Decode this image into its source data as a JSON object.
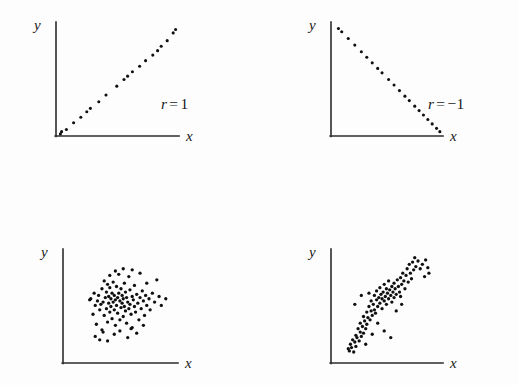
{
  "figure": {
    "background_color": "#fdfdfd",
    "ink_color": "#101010",
    "width": 518,
    "height": 385
  },
  "panels": [
    {
      "id": "panel-r-1",
      "position": "top-left",
      "x_axis_label": "x",
      "y_axis_label": "y",
      "r_symbol": "r",
      "r_equals": "=",
      "r_value": "1",
      "r_label_full": "r = 1",
      "pattern": "perfect positive linear"
    },
    {
      "id": "panel-r-neg1",
      "position": "top-right",
      "x_axis_label": "x",
      "y_axis_label": "y",
      "r_symbol": "r",
      "r_equals": "=",
      "r_value": "−1",
      "r_label_full": "r = −1",
      "pattern": "perfect negative linear"
    },
    {
      "id": "panel-r-point4",
      "position": "bottom-left",
      "x_axis_label": "x",
      "y_axis_label": "y",
      "r_symbol": "r",
      "r_equals": "=",
      "r_value": ".4",
      "r_label_full": "r = .4",
      "pattern": "weak positive scatter"
    },
    {
      "id": "panel-r-point8",
      "position": "bottom-right",
      "x_axis_label": "x",
      "y_axis_label": "y",
      "r_symbol": "r",
      "r_equals": "=",
      "r_value": ".8",
      "r_label_full": "r = .8",
      "pattern": "strong positive scatter"
    }
  ],
  "chart_data": [
    {
      "type": "scatter",
      "title": "r = 1",
      "xlabel": "x",
      "ylabel": "y",
      "r": 1.0,
      "xlim": [
        0,
        100
      ],
      "ylim": [
        0,
        100
      ],
      "grid": false,
      "legend": "none",
      "points": [
        [
          2,
          1
        ],
        [
          3,
          3
        ],
        [
          7,
          5
        ],
        [
          13,
          11
        ],
        [
          19,
          16
        ],
        [
          24,
          21
        ],
        [
          27,
          24
        ],
        [
          34,
          30
        ],
        [
          40,
          36
        ],
        [
          49,
          44
        ],
        [
          55,
          50
        ],
        [
          58,
          53
        ],
        [
          62,
          57
        ],
        [
          68,
          62
        ],
        [
          73,
          67
        ],
        [
          79,
          72
        ],
        [
          83,
          76
        ],
        [
          86,
          80
        ],
        [
          91,
          85
        ],
        [
          96,
          92
        ],
        [
          98,
          95
        ]
      ]
    },
    {
      "type": "scatter",
      "title": "r = −1",
      "xlabel": "x",
      "ylabel": "y",
      "r": -1.0,
      "xlim": [
        0,
        100
      ],
      "ylim": [
        0,
        100
      ],
      "grid": false,
      "legend": "none",
      "points": [
        [
          5,
          96
        ],
        [
          8,
          93
        ],
        [
          14,
          87
        ],
        [
          20,
          81
        ],
        [
          26,
          75
        ],
        [
          31,
          70
        ],
        [
          36,
          65
        ],
        [
          41,
          60
        ],
        [
          45,
          56
        ],
        [
          51,
          50
        ],
        [
          56,
          45
        ],
        [
          61,
          40
        ],
        [
          66,
          35
        ],
        [
          70,
          31
        ],
        [
          75,
          26
        ],
        [
          79,
          22
        ],
        [
          83,
          18
        ],
        [
          87,
          14
        ],
        [
          91,
          10
        ],
        [
          95,
          6
        ],
        [
          98,
          3
        ]
      ]
    },
    {
      "type": "scatter",
      "title": "r = .4",
      "xlabel": "x",
      "ylabel": "y",
      "r": 0.4,
      "xlim": [
        0,
        100
      ],
      "ylim": [
        0,
        100
      ],
      "grid": false,
      "legend": "none",
      "points": [
        [
          22,
          56
        ],
        [
          23,
          57
        ],
        [
          25,
          43
        ],
        [
          26,
          62
        ],
        [
          27,
          51
        ],
        [
          28,
          34
        ],
        [
          29,
          55
        ],
        [
          30,
          60
        ],
        [
          31,
          47
        ],
        [
          32,
          52
        ],
        [
          33,
          29
        ],
        [
          33,
          66
        ],
        [
          34,
          54
        ],
        [
          35,
          42
        ],
        [
          35,
          73
        ],
        [
          36,
          58
        ],
        [
          37,
          48
        ],
        [
          37,
          63
        ],
        [
          38,
          36
        ],
        [
          38,
          70
        ],
        [
          39,
          53
        ],
        [
          39,
          59
        ],
        [
          40,
          45
        ],
        [
          40,
          67
        ],
        [
          41,
          50
        ],
        [
          41,
          57
        ],
        [
          42,
          39
        ],
        [
          42,
          62
        ],
        [
          43,
          54
        ],
        [
          43,
          72
        ],
        [
          44,
          47
        ],
        [
          44,
          60
        ],
        [
          45,
          33
        ],
        [
          45,
          56
        ],
        [
          46,
          51
        ],
        [
          46,
          68
        ],
        [
          47,
          44
        ],
        [
          47,
          58
        ],
        [
          48,
          62
        ],
        [
          48,
          79
        ],
        [
          49,
          38
        ],
        [
          49,
          55
        ],
        [
          50,
          49
        ],
        [
          50,
          66
        ],
        [
          51,
          53
        ],
        [
          51,
          60
        ],
        [
          52,
          41
        ],
        [
          52,
          57
        ],
        [
          53,
          50
        ],
        [
          53,
          71
        ],
        [
          54,
          46
        ],
        [
          54,
          63
        ],
        [
          55,
          35
        ],
        [
          55,
          58
        ],
        [
          56,
          54
        ],
        [
          57,
          48
        ],
        [
          57,
          77
        ],
        [
          58,
          52
        ],
        [
          58,
          65
        ],
        [
          59,
          43
        ],
        [
          60,
          59
        ],
        [
          60,
          31
        ],
        [
          61,
          56
        ],
        [
          62,
          50
        ],
        [
          62,
          69
        ],
        [
          63,
          45
        ],
        [
          64,
          61
        ],
        [
          65,
          53
        ],
        [
          66,
          38
        ],
        [
          67,
          58
        ],
        [
          68,
          48
        ],
        [
          69,
          64
        ],
        [
          70,
          55
        ],
        [
          71,
          42
        ],
        [
          72,
          60
        ],
        [
          73,
          51
        ],
        [
          75,
          57
        ],
        [
          76,
          47
        ],
        [
          78,
          62
        ],
        [
          80,
          54
        ],
        [
          82,
          74
        ],
        [
          84,
          59
        ],
        [
          86,
          51
        ],
        [
          90,
          57
        ],
        [
          27,
          23
        ],
        [
          31,
          20
        ],
        [
          38,
          19
        ],
        [
          34,
          27
        ],
        [
          44,
          25
        ],
        [
          49,
          28
        ],
        [
          56,
          22
        ],
        [
          59,
          30
        ],
        [
          64,
          26
        ],
        [
          70,
          33
        ],
        [
          73,
          71
        ],
        [
          67,
          80
        ],
        [
          60,
          83
        ],
        [
          52,
          84
        ],
        [
          45,
          82
        ],
        [
          40,
          78
        ]
      ]
    },
    {
      "type": "scatter",
      "title": "r = .8",
      "xlabel": "x",
      "ylabel": "y",
      "r": 0.8,
      "xlim": [
        0,
        100
      ],
      "ylim": [
        0,
        100
      ],
      "grid": false,
      "legend": "none",
      "points": [
        [
          14,
          12
        ],
        [
          15,
          10
        ],
        [
          16,
          16
        ],
        [
          17,
          13
        ],
        [
          18,
          20
        ],
        [
          19,
          9
        ],
        [
          20,
          18
        ],
        [
          21,
          24
        ],
        [
          21,
          14
        ],
        [
          22,
          22
        ],
        [
          23,
          30
        ],
        [
          24,
          19
        ],
        [
          25,
          27
        ],
        [
          25,
          35
        ],
        [
          26,
          23
        ],
        [
          27,
          32
        ],
        [
          28,
          41
        ],
        [
          28,
          26
        ],
        [
          29,
          37
        ],
        [
          30,
          30
        ],
        [
          31,
          45
        ],
        [
          31,
          34
        ],
        [
          32,
          40
        ],
        [
          33,
          50
        ],
        [
          34,
          38
        ],
        [
          35,
          46
        ],
        [
          35,
          55
        ],
        [
          36,
          42
        ],
        [
          37,
          52
        ],
        [
          38,
          47
        ],
        [
          38,
          60
        ],
        [
          39,
          44
        ],
        [
          40,
          56
        ],
        [
          40,
          64
        ],
        [
          41,
          50
        ],
        [
          42,
          58
        ],
        [
          43,
          53
        ],
        [
          43,
          67
        ],
        [
          44,
          61
        ],
        [
          45,
          48
        ],
        [
          45,
          57
        ],
        [
          46,
          63
        ],
        [
          47,
          55
        ],
        [
          47,
          70
        ],
        [
          48,
          59
        ],
        [
          49,
          66
        ],
        [
          49,
          52
        ],
        [
          50,
          62
        ],
        [
          51,
          57
        ],
        [
          51,
          73
        ],
        [
          52,
          65
        ],
        [
          53,
          60
        ],
        [
          54,
          68
        ],
        [
          54,
          54
        ],
        [
          55,
          63
        ],
        [
          56,
          71
        ],
        [
          56,
          58
        ],
        [
          57,
          66
        ],
        [
          58,
          61
        ],
        [
          59,
          74
        ],
        [
          60,
          68
        ],
        [
          61,
          63
        ],
        [
          62,
          76
        ],
        [
          62,
          59
        ],
        [
          63,
          70
        ],
        [
          64,
          80
        ],
        [
          65,
          73
        ],
        [
          66,
          66
        ],
        [
          67,
          78
        ],
        [
          68,
          84
        ],
        [
          69,
          72
        ],
        [
          70,
          88
        ],
        [
          71,
          80
        ],
        [
          72,
          75
        ],
        [
          73,
          90
        ],
        [
          74,
          83
        ],
        [
          75,
          94
        ],
        [
          76,
          86
        ],
        [
          78,
          91
        ],
        [
          80,
          84
        ],
        [
          82,
          88
        ],
        [
          84,
          77
        ],
        [
          85,
          92
        ],
        [
          87,
          85
        ],
        [
          88,
          80
        ],
        [
          20,
          52
        ],
        [
          26,
          60
        ],
        [
          33,
          62
        ],
        [
          41,
          35
        ],
        [
          47,
          28
        ],
        [
          53,
          22
        ],
        [
          58,
          46
        ],
        [
          30,
          16
        ],
        [
          36,
          25
        ],
        [
          63,
          52
        ]
      ]
    }
  ]
}
